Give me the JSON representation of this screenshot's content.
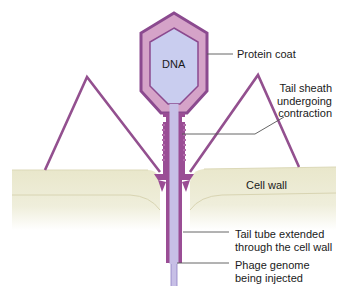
{
  "diagram": {
    "colors": {
      "coat_outer": "#8e4a90",
      "coat_fill": "#d9a9cc",
      "capsid_inner": "#c8cdef",
      "sheath": "#9a4d95",
      "tube": "#c5bde6",
      "cell_wall_top": "#ecebd2",
      "cell_wall_bottom": "#f6f5ea",
      "leader_line": "#444444"
    },
    "inner_label": "DNA",
    "labels": [
      {
        "id": "protein-coat",
        "lines": [
          "Protein coat"
        ]
      },
      {
        "id": "tail-sheath",
        "lines": [
          "Tail sheath",
          "undergoing",
          "contraction"
        ]
      },
      {
        "id": "cell-wall",
        "lines": [
          "Cell wall"
        ]
      },
      {
        "id": "tail-tube",
        "lines": [
          "Tail tube extended",
          "through the cell wall"
        ]
      },
      {
        "id": "phage-genome",
        "lines": [
          "Phage genome",
          "being injected"
        ]
      }
    ]
  }
}
